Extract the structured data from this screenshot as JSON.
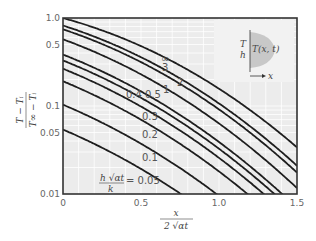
{
  "chart_data": {
    "type": "line",
    "title": "",
    "xlabel": "x / (2 √(αt))",
    "ylabel": "(T − T_i) / (T_∞ − T_i)",
    "xlim": [
      0,
      1.5
    ],
    "ylim": [
      0.01,
      1.0
    ],
    "yscale": "log",
    "grid": true,
    "legend_position": "none",
    "x_ticks": [
      "0",
      "0.5",
      "1.0",
      "1.5"
    ],
    "y_ticks": [
      "0.01",
      "0.05",
      "0.1",
      "0.5",
      "1.0"
    ],
    "parameter_label": "h √(αt) / k",
    "series": [
      {
        "name": "0.05",
        "param": 0.05
      },
      {
        "name": "0.1",
        "param": 0.1
      },
      {
        "name": "0.2",
        "param": 0.2
      },
      {
        "name": "0.3",
        "param": 0.3
      },
      {
        "name": "0.4",
        "param": 0.4
      },
      {
        "name": "0.5",
        "param": 0.5
      },
      {
        "name": "1",
        "param": 1
      },
      {
        "name": "2",
        "param": 2
      },
      {
        "name": "3",
        "param": 3
      },
      {
        "name": "∞",
        "param": 1000
      }
    ],
    "inset": {
      "boundary_label_top": "T",
      "boundary_label_bottom": "h",
      "field_label": "T(x, t)",
      "axis_label": "x"
    }
  },
  "labels": {
    "inf": "∞",
    "p3": "3",
    "p2": "2",
    "p1": "1",
    "p04": "0.4",
    "p05": "0.5",
    "p03": "0.3",
    "p02": "0.2",
    "p01": "0.1",
    "p005": "= 0.05",
    "param_num": "h √αt",
    "param_den": "k",
    "x_num": "x",
    "x_den": "2 √αt",
    "y_num": "T − Tᵢ",
    "y_den": "T∞ − Tᵢ",
    "inset_T": "T",
    "inset_h": "h",
    "inset_field": "T(x, t)",
    "inset_x": "x",
    "t0": "0",
    "t05": "0.5",
    "t10": "1.0",
    "t15": "1.5",
    "y001": "0.01",
    "y005": "0.05",
    "y01": "0.1",
    "y05": "0.5",
    "y10": "1.0"
  }
}
